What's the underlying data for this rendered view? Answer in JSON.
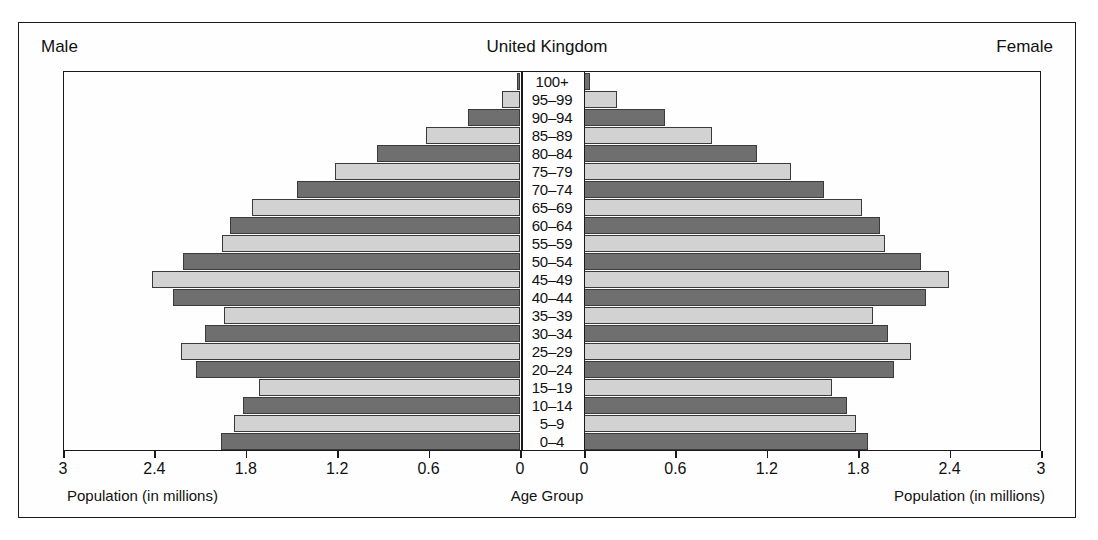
{
  "header": {
    "male_label": "Male",
    "title": "United Kingdom",
    "female_label": "Female"
  },
  "captions": {
    "left": "Population (in millions)",
    "center": "Age Group",
    "right": "Population (in millions)"
  },
  "axis": {
    "left_ticks": [
      "3",
      "2.4",
      "1.8",
      "1.2",
      "0.6",
      "0"
    ],
    "right_ticks": [
      "0",
      "0.6",
      "1.2",
      "1.8",
      "2.4",
      "3"
    ],
    "max": 3,
    "tick_step": 0.6
  },
  "colors": {
    "bar_dark": "#6f6f6f",
    "bar_light": "#d2d2d2",
    "bar_outline": "#3a3a3a",
    "frame": "#1a1a1a",
    "background": "#fefefe"
  },
  "chart_data": {
    "type": "bar",
    "subtype": "population-pyramid",
    "title": "United Kingdom",
    "xlabel": "Population (in millions)",
    "ylabel": "Age Group",
    "xlim": [
      0,
      3
    ],
    "grid": false,
    "legend": [
      "Male",
      "Female"
    ],
    "legend_position": "top-left and top-right",
    "categories": [
      "0-4",
      "5-9",
      "10-14",
      "15-19",
      "20-24",
      "25-29",
      "30-34",
      "35-39",
      "40-44",
      "45-49",
      "50-54",
      "55-59",
      "60-64",
      "65-69",
      "70-74",
      "75-79",
      "80-84",
      "85-89",
      "90-94",
      "95-99",
      "100+"
    ],
    "series": [
      {
        "name": "Male",
        "side": "left",
        "values": [
          1.97,
          1.88,
          1.82,
          1.72,
          2.13,
          2.23,
          2.07,
          1.95,
          2.28,
          2.42,
          2.22,
          1.96,
          1.91,
          1.76,
          1.47,
          1.22,
          0.94,
          0.62,
          0.34,
          0.12,
          0.02
        ]
      },
      {
        "name": "Female",
        "side": "right",
        "values": [
          1.87,
          1.79,
          1.73,
          1.63,
          2.04,
          2.15,
          2.0,
          1.9,
          2.25,
          2.4,
          2.22,
          1.98,
          1.95,
          1.83,
          1.58,
          1.36,
          1.14,
          0.84,
          0.53,
          0.22,
          0.04
        ]
      }
    ]
  }
}
